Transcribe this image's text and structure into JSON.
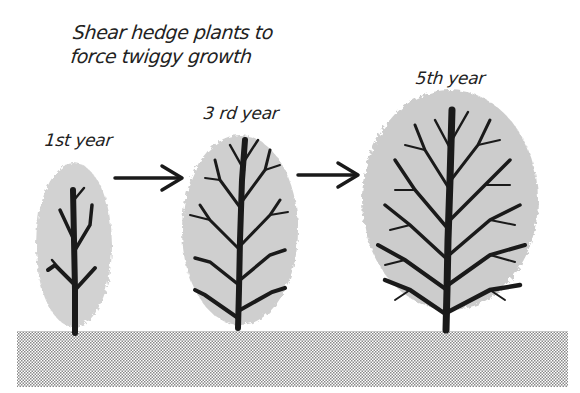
{
  "title": {
    "line1": "Shear hedge plants to",
    "line2": "force twiggy growth"
  },
  "stages": [
    {
      "label": "1st year"
    },
    {
      "label": "3 rd year"
    },
    {
      "label": "5th year"
    }
  ],
  "arrows": [
    {
      "from": "1st year",
      "to": "3 rd year"
    },
    {
      "from": "3 rd year",
      "to": "5th year"
    }
  ],
  "colors": {
    "ink": "#1a1a1a",
    "foliage": "#b5b5b5",
    "ground": "#c8c8c8",
    "background": "#ffffff"
  }
}
